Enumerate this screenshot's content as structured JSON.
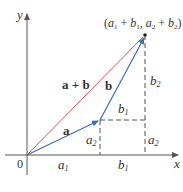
{
  "diagram": {
    "colors": {
      "axis": "#555555",
      "vector_a": "#3a6fb0",
      "vector_b": "#3a6fb0",
      "vector_sum": "#d9534f",
      "dashed": "#555555",
      "text": "#333333"
    },
    "axes": {
      "x_label": "x",
      "y_label": "y",
      "origin_label": "0"
    },
    "vectors": [
      {
        "name": "a",
        "label": "a",
        "from": [
          0,
          0
        ],
        "to": [
          "a1",
          "a2"
        ]
      },
      {
        "name": "b",
        "label": "b",
        "from": [
          "a1",
          "a2"
        ],
        "to": [
          "a1+b1",
          "a2+b2"
        ]
      },
      {
        "name": "a+b",
        "label": "a + b",
        "from": [
          0,
          0
        ],
        "to": [
          "a1+b1",
          "a2+b2"
        ]
      }
    ],
    "endpoint_label": {
      "open": "(",
      "a": "a",
      "s1": "1",
      "plus1": " + ",
      "b": "b",
      "s2": "1",
      "comma": ", ",
      "a2": "a",
      "s3": "2",
      "plus2": " + ",
      "b2": "b",
      "s4": "2",
      "close": ")"
    },
    "component_labels": {
      "a1": {
        "main": "a",
        "sub": "1"
      },
      "b1_axis": {
        "main": "b",
        "sub": "1"
      },
      "b1_horizontal": {
        "main": "b",
        "sub": "1"
      },
      "a2_left": {
        "main": "a",
        "sub": "2"
      },
      "a2_right": {
        "main": "a",
        "sub": "2"
      },
      "b2": {
        "main": "b",
        "sub": "2"
      }
    }
  }
}
